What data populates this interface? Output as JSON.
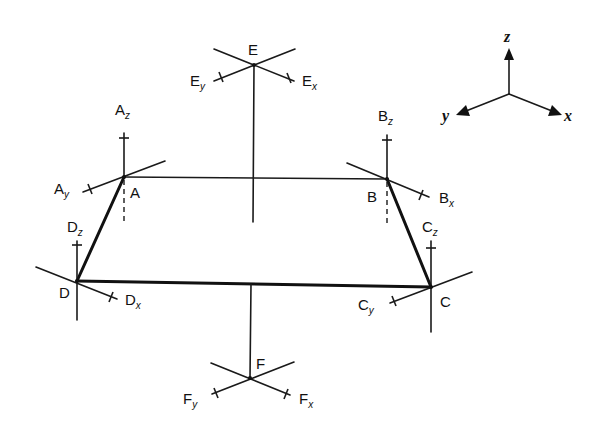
{
  "diagram": {
    "nodes": {
      "A": {
        "label": "A",
        "x": 124,
        "y": 177
      },
      "B": {
        "label": "B",
        "x": 387,
        "y": 179
      },
      "C": {
        "label": "C",
        "x": 431,
        "y": 287
      },
      "D": {
        "label": "D",
        "x": 77,
        "y": 281
      },
      "E": {
        "label": "E",
        "x": 254,
        "y": 65
      },
      "F": {
        "label": "F",
        "x": 250,
        "y": 378
      }
    },
    "members": [
      {
        "from": "A",
        "to": "B",
        "weight": "thin"
      },
      {
        "from": "A",
        "to": "D",
        "weight": "thick"
      },
      {
        "from": "B",
        "to": "C",
        "weight": "thick"
      },
      {
        "from": "D",
        "to": "C",
        "weight": "thick"
      }
    ],
    "force_labels": {
      "Az": {
        "main": "A",
        "sub": "z"
      },
      "Ay": {
        "main": "A",
        "sub": "y"
      },
      "Bz": {
        "main": "B",
        "sub": "z"
      },
      "Bx": {
        "main": "B",
        "sub": "x"
      },
      "Cz": {
        "main": "C",
        "sub": "z"
      },
      "Cy": {
        "main": "C",
        "sub": "y"
      },
      "Dz": {
        "main": "D",
        "sub": "z"
      },
      "Dx": {
        "main": "D",
        "sub": "x"
      },
      "Ey": {
        "main": "E",
        "sub": "y"
      },
      "Ex": {
        "main": "E",
        "sub": "x"
      },
      "Fy": {
        "main": "F",
        "sub": "y"
      },
      "Fx": {
        "main": "F",
        "sub": "x"
      }
    },
    "axes": {
      "origin": {
        "x": 509,
        "y": 94
      },
      "x_label": "x",
      "y_label": "y",
      "z_label": "z"
    }
  }
}
